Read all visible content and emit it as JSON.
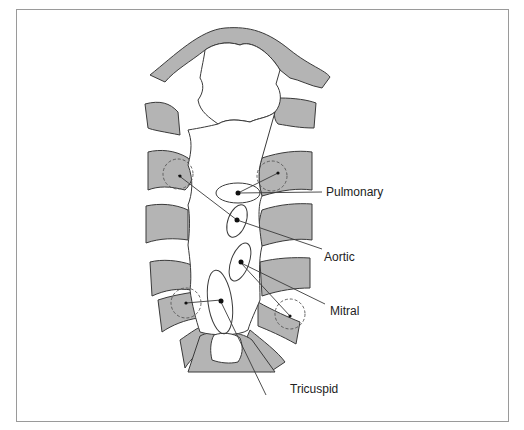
{
  "figure": {
    "labels": {
      "pulmonary": "Pulmonary",
      "aortic": "Aortic",
      "mitral": "Mitral",
      "tricuspid": "Tricuspid"
    },
    "colors": {
      "rib_fill": "#b4b4b4",
      "outline": "#3a3a3a",
      "frame_border": "#9a9a9a",
      "background": "#ffffff"
    }
  }
}
